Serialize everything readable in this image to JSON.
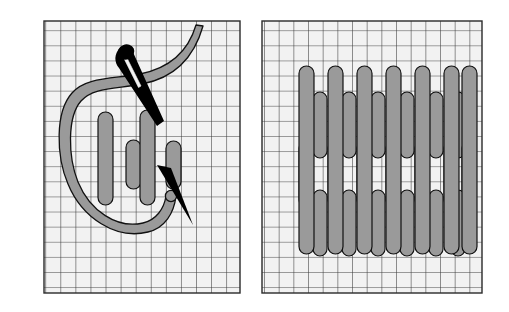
{
  "illustration": {
    "title": "Needlework stitch diagram",
    "description": "Two-panel embroidery instruction illustration on gridded canvas",
    "background_color": "#ffffff",
    "canvas_fill": "#f2f2f2",
    "grid_line_color": "#3a3a3a",
    "thread_fill": "#9a9a9a",
    "thread_outline": "#1a1a1a",
    "needle_fill": "#000000"
  },
  "panels": [
    {
      "id": "panel-left",
      "name": "needle-and-thread-panel",
      "label": "Working the stitch with needle and thread",
      "grid": {
        "x": 44,
        "y": 21,
        "width": 196,
        "height": 272,
        "cols": 13,
        "rows": 18,
        "cell_width": 15.1,
        "cell_height": 15.1
      },
      "elements": [
        {
          "name": "curved-thread-c-shape",
          "type": "thread-loop",
          "shape": "C"
        },
        {
          "name": "needle-body",
          "type": "needle",
          "color": "#000000"
        },
        {
          "name": "needle-eye",
          "type": "needle-eye"
        },
        {
          "name": "needle-point",
          "type": "needle-tip"
        },
        {
          "name": "stitch-bar",
          "type": "stitch",
          "count": 4
        }
      ],
      "stitches": [
        {
          "x": 98,
          "y": 112,
          "w": 14,
          "h": 92
        },
        {
          "x": 126,
          "y": 140,
          "w": 14,
          "h": 48
        },
        {
          "x": 139,
          "y": 110,
          "w": 14,
          "h": 92
        },
        {
          "x": 166,
          "y": 140,
          "w": 14,
          "h": 48
        }
      ]
    },
    {
      "id": "panel-right",
      "name": "completed-stitch-pattern-panel",
      "label": "Completed interlocking stitch pattern",
      "grid": {
        "x": 262,
        "y": 21,
        "width": 220,
        "height": 272,
        "cols": 15,
        "rows": 18,
        "cell_width": 14.7,
        "cell_height": 15.1
      },
      "pattern": {
        "long_columns": 7,
        "short_columns": 7,
        "rows_of_short_stitches": 4,
        "long_column_x": [
          300,
          329,
          358,
          387,
          416,
          445,
          462
        ],
        "long_column_top": 66,
        "long_column_bottom": 252,
        "short_rows_y": [
          92,
          141,
          190,
          217
        ],
        "stitch_width": 14
      }
    }
  ]
}
